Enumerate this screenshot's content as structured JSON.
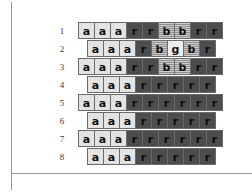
{
  "figure": {
    "title": "",
    "rule_color": "#9a9a9a",
    "cell_border_color": "#6b6b6b"
  },
  "legend_colors": {
    "a": "#e3e3e3",
    "r": "#4d4d4d",
    "b": "#8f8f8f",
    "g": "#ededed"
  },
  "chart_data": {
    "type": "heatmap",
    "title": "",
    "xlabel": "",
    "ylabel": "",
    "grid": true,
    "legend_position": "none",
    "layout": "offset-lattice",
    "note": "Odd-numbered rows contain 9 cells and are flush left; even-numbered rows contain 8 cells and are shifted right by half a cell width.",
    "row_labels": [
      "1",
      "2",
      "3",
      "4",
      "5",
      "6",
      "7",
      "8"
    ],
    "states": [
      "a",
      "r",
      "b",
      "g"
    ],
    "rows": [
      {
        "label": "1",
        "offset": 0,
        "cells": [
          "a",
          "a",
          "a",
          "r",
          "r",
          "b",
          "b",
          "r",
          "r"
        ]
      },
      {
        "label": "2",
        "offset": 1,
        "cells": [
          "a",
          "a",
          "a",
          "r",
          "b",
          "g",
          "b",
          "r"
        ]
      },
      {
        "label": "3",
        "offset": 0,
        "cells": [
          "a",
          "a",
          "a",
          "r",
          "r",
          "b",
          "b",
          "r",
          "r"
        ]
      },
      {
        "label": "4",
        "offset": 1,
        "cells": [
          "a",
          "a",
          "a",
          "r",
          "r",
          "r",
          "r",
          "r"
        ]
      },
      {
        "label": "5",
        "offset": 0,
        "cells": [
          "a",
          "a",
          "a",
          "r",
          "r",
          "r",
          "r",
          "r",
          "r"
        ]
      },
      {
        "label": "6",
        "offset": 1,
        "cells": [
          "a",
          "a",
          "a",
          "r",
          "r",
          "r",
          "r",
          "r"
        ]
      },
      {
        "label": "7",
        "offset": 0,
        "cells": [
          "a",
          "a",
          "a",
          "r",
          "r",
          "r",
          "r",
          "r",
          "r"
        ]
      },
      {
        "label": "8",
        "offset": 1,
        "cells": [
          "a",
          "a",
          "a",
          "r",
          "r",
          "r",
          "r",
          "r"
        ]
      }
    ]
  }
}
